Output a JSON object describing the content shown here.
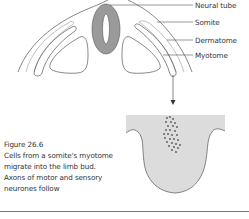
{
  "figure": {
    "labels": {
      "neural_tube": "Neural tube",
      "somite": "Somite",
      "dermatome": "Dermatome",
      "myotome": "Myotome"
    },
    "caption": {
      "title": "Figure 26.6",
      "lines": [
        "Cells from a somite's myotome",
        "migrate into the limb bud.",
        "Axons of motor and sensory",
        "neurones follow"
      ]
    },
    "colors": {
      "neural_tube_fill": "#9a9a9a",
      "limb_bud_fill": "#dcdcdc",
      "outline": "#555555",
      "dermatome_line": "#b0b0b0",
      "cells": "#555555"
    }
  }
}
